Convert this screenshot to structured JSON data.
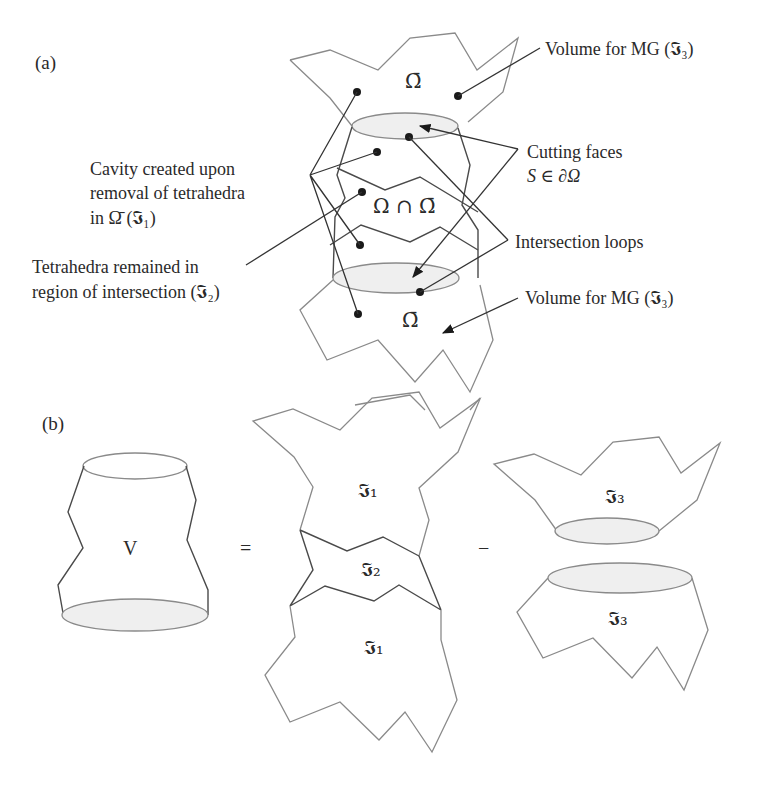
{
  "panels": {
    "a": {
      "tag": "(a)",
      "region_top_label": "Ω̄",
      "region_middle_label": "Ω ∩ Ω̄",
      "region_bottom_label": "Ω̄",
      "callouts": {
        "volume_mg_top": "Volume for MG (𝕴₃)",
        "cutting_faces_line1": "Cutting faces",
        "cutting_faces_line2": "S ∈ ∂Ω",
        "cavity_line1": "Cavity created upon",
        "cavity_line2": "removal of tetrahedra",
        "cavity_line3": "in Ω̄ (𝕴₁)",
        "tetra_line1": "Tetrahedra remained in",
        "tetra_line2": "region of intersection (𝕴₂)",
        "intersection_loops": "Intersection loops",
        "volume_mg_bottom": "Volume for MG (𝕴₃)"
      }
    },
    "b": {
      "tag": "(b)",
      "v_label": "V",
      "equals": "=",
      "minus": "−",
      "i1_top": "𝕴₁",
      "i2": "𝕴₂",
      "i1_bottom": "𝕴₁",
      "i3_top": "𝕴₃",
      "i3_bottom": "𝕴₃"
    }
  },
  "colors": {
    "outline": "#8a8a8a",
    "leader": "#333333",
    "face_fill": "#efefef",
    "text": "#2a2a2a"
  }
}
